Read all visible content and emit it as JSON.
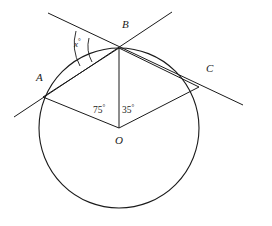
{
  "figure": {
    "background_color": "#ffffff",
    "stroke_color": "#1a1a1a"
  },
  "points": {
    "A": {
      "label": "A",
      "x": 43,
      "y": 97,
      "label_x": 36,
      "label_y": 78
    },
    "B": {
      "label": "B",
      "x": 119,
      "y": 48,
      "label_x": 122,
      "label_y": 22
    },
    "C": {
      "label": "C",
      "x": 199,
      "y": 87,
      "label_x": 206,
      "label_y": 68
    },
    "O": {
      "label": "O",
      "x": 119,
      "y": 128,
      "label_x": 115,
      "label_y": 137
    }
  },
  "angles": {
    "aob": {
      "value": "75",
      "degree_symbol": "°",
      "label_x": 94,
      "label_y": 104
    },
    "boc": {
      "value": "35",
      "degree_symbol": "°",
      "label_x": 123,
      "label_y": 104
    },
    "x_at_b": {
      "value": "x",
      "degree_symbol": "°",
      "label_x": 74,
      "label_y": 38
    }
  },
  "circle": {
    "center_x": 119,
    "center_y": 128,
    "radius": 80
  },
  "segments": [
    {
      "name": "radius-OA",
      "x1": 119,
      "y1": 128,
      "x2": 43,
      "y2": 97
    },
    {
      "name": "radius-OB",
      "x1": 119,
      "y1": 128,
      "x2": 119,
      "y2": 48
    },
    {
      "name": "radius-OC",
      "x1": 119,
      "y1": 128,
      "x2": 199,
      "y2": 87
    },
    {
      "name": "chord-AB",
      "x1": 43,
      "y1": 97,
      "x2": 119,
      "y2": 48
    },
    {
      "name": "chord-BC",
      "x1": 119,
      "y1": 48,
      "x2": 199,
      "y2": 87
    }
  ],
  "tangents": [
    {
      "name": "tangent-at-B",
      "x1": 48,
      "y1": 13,
      "x2": 243,
      "y2": 105
    },
    {
      "name": "tangent-through-A-and-B-upper",
      "x1": 14,
      "y1": 117,
      "x2": 172,
      "y2": 12
    }
  ]
}
